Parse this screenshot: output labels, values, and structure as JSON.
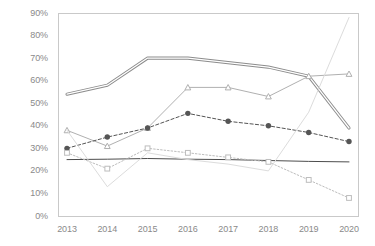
{
  "title": {
    "clipped_text": "图1 一种趋势图：不同类别的占比随年份变化情况，共包含六条折线系列"
  },
  "chart_data": {
    "type": "line",
    "title": "",
    "xlabel": "",
    "ylabel": "",
    "grid": false,
    "legend": "none",
    "x": [
      "2013",
      "2014",
      "2015",
      "2016",
      "2017",
      "2018",
      "2019",
      "2020"
    ],
    "ylim": [
      0,
      90
    ],
    "ytick_labels": [
      "0%",
      "10%",
      "20%",
      "30%",
      "40%",
      "50%",
      "60%",
      "70%",
      "80%",
      "90%"
    ],
    "ytick_values": [
      0,
      10,
      20,
      30,
      40,
      50,
      60,
      70,
      80,
      90
    ],
    "series": [
      {
        "name": "series-1-double-line",
        "marker": "none",
        "style": "double-solid",
        "color": "#8c8c8c",
        "values": [
          54,
          58,
          70,
          70,
          68,
          66,
          62,
          39
        ]
      },
      {
        "name": "series-2-triangle",
        "marker": "triangle",
        "style": "solid",
        "color": "#b0b0b0",
        "values": [
          38,
          31,
          39,
          57,
          57,
          53,
          62,
          63
        ]
      },
      {
        "name": "series-3-filled-circle",
        "marker": "circle-filled",
        "style": "dashed",
        "color": "#555555",
        "values": [
          30,
          35,
          39,
          45.5,
          42,
          40,
          37,
          33
        ]
      },
      {
        "name": "series-4-flat-solid",
        "marker": "none",
        "style": "solid",
        "color": "#4d4d4d",
        "values": [
          25,
          25.2,
          25.5,
          25.2,
          25,
          24.6,
          24.2,
          24
        ]
      },
      {
        "name": "series-5-open-square",
        "marker": "square-open",
        "style": "dotted",
        "color": "#bdbdbd",
        "values": [
          28,
          21,
          30,
          28,
          26,
          24,
          16,
          8
        ]
      },
      {
        "name": "series-6-light-rise",
        "marker": "none",
        "style": "solid",
        "color": "#dcdcdc",
        "values": [
          38,
          13,
          28,
          25,
          23,
          20,
          46,
          88
        ]
      }
    ]
  }
}
